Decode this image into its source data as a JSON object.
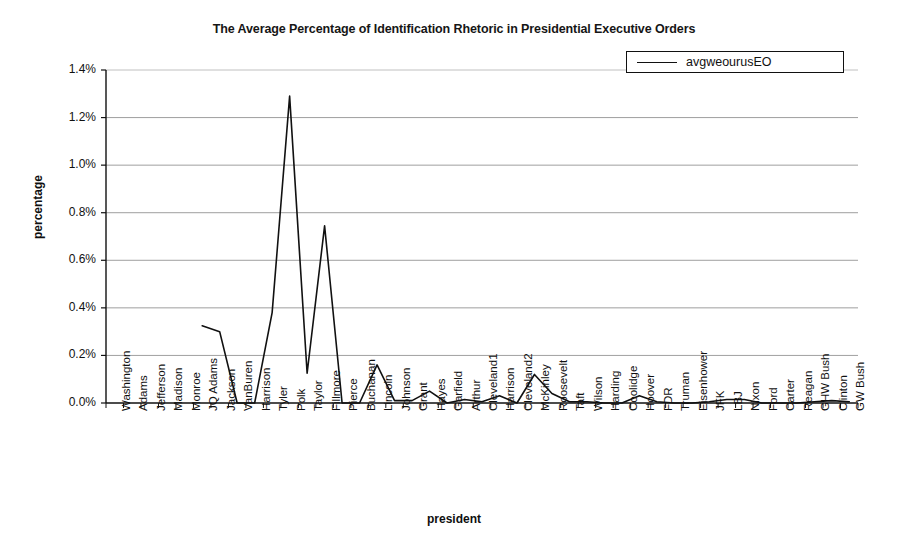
{
  "chart_data": {
    "type": "line",
    "title": "The Average Percentage of Identification Rhetoric in Presidential Executive Orders",
    "xlabel": "president",
    "ylabel": "percentage",
    "ylim": [
      0.0,
      1.4
    ],
    "ytick_labels": [
      "0.0%",
      "0.2%",
      "0.4%",
      "0.6%",
      "0.8%",
      "1.0%",
      "1.2%",
      "1.4%"
    ],
    "ytick_values": [
      0.0,
      0.2,
      0.4,
      0.6,
      0.8,
      1.0,
      1.2,
      1.4
    ],
    "grid": "horizontal",
    "legend_position": "top-right",
    "legend": [
      "avgweourusEO"
    ],
    "line_color": "#111111",
    "categories": [
      "Washington",
      "Adams",
      "Jefferson",
      "Madison",
      "Monroe",
      "JQ Adams",
      "Jackson",
      "VanBuren",
      "Harrison",
      "Tyler",
      "Polk",
      "Taylor",
      "Fillmore",
      "Pierce",
      "Buchanan",
      "Lincoln",
      "Johnson",
      "Grant",
      "Hayes",
      "Garfield",
      "Arthur",
      "Cleveland1",
      "Harrison",
      "Cleveland2",
      "McKinley",
      "Roosevelt",
      "Taft",
      "Wilson",
      "Harding",
      "Coolidge",
      "Hoover",
      "FDR",
      "Truman",
      "Eisenhower",
      "JFK",
      "LBJ",
      "Nixon",
      "Ford",
      "Carter",
      "Reagan",
      "GHW Bush",
      "Clinton",
      "GW Bush"
    ],
    "series": [
      {
        "name": "avgweourusEO",
        "start_index": 5,
        "values": [
          null,
          null,
          null,
          null,
          null,
          0.325,
          0.3,
          0.0,
          0.0,
          0.38,
          1.29,
          0.125,
          0.745,
          0.0,
          0.0,
          0.16,
          0.01,
          0.01,
          0.05,
          0.0,
          0.015,
          0.005,
          0.03,
          0.0,
          0.12,
          0.04,
          0.005,
          0.005,
          0.0,
          0.0,
          0.03,
          0.005,
          0.0,
          0.0,
          0.005,
          0.015,
          0.015,
          0.0,
          0.0,
          0.0,
          0.005,
          0.01,
          0.005
        ]
      }
    ]
  }
}
